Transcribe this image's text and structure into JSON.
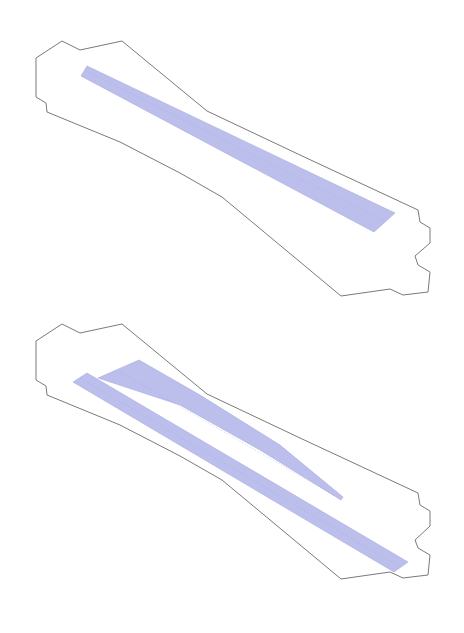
{
  "diagram": {
    "panels": [
      {
        "name": "top-plan",
        "outline_points": "36,58 62,41 80,50 122,41 207,111 300,155 418,210 420,222 430,228 430,243 415,256 418,265 430,272 428,292 403,295 390,289 341,296 222,197 180,173 120,142 47,112 46,103 36,97",
        "shapes": [
          {
            "name": "diagonal-strip",
            "points": "81,76 87,66 395,213 374,232"
          }
        ]
      },
      {
        "name": "bottom-plan",
        "outline_points": "36,341 62,324 80,333 122,324 207,394 300,438 418,493 420,505 430,511 430,526 415,540 418,548 430,555 428,575 403,578 390,572 341,579 222,480 180,456 120,425 47,395 46,386 36,380",
        "shapes": [
          {
            "name": "wedge",
            "points": "139,360 98,378 180,405 260,450 341,500 343,497 280,445 200,395"
          },
          {
            "name": "diagonal-strip",
            "points": "73,382 87,373 408,562 394,572"
          }
        ]
      }
    ],
    "colors": {
      "fill": "#b6b9ea",
      "outline": "#7a7a7a",
      "background": "#ffffff"
    }
  }
}
